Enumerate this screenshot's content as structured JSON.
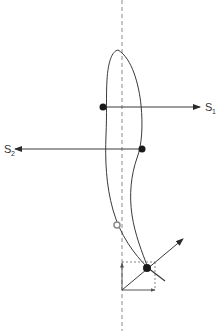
{
  "diagram": {
    "type": "vector-force diagram",
    "colors": {
      "line": "#3a3a3a",
      "dashed_axis": "#8a8a8a",
      "dot": "#1a1a1a",
      "hollow_dot": "#9a9a9a",
      "background": "#ffffff"
    },
    "labels": {
      "s1_main": "S",
      "s1_sub": "1",
      "s2_main": "S",
      "s2_sub": "2"
    },
    "elements": [
      {
        "id": "axis",
        "kind": "dashed-vertical-line",
        "x": 122
      },
      {
        "id": "body",
        "kind": "closed-curve",
        "description": "elongated body shape tapering to a point at bottom"
      },
      {
        "id": "s1",
        "kind": "arrow",
        "from": [
          103,
          107
        ],
        "to": [
          200,
          107
        ],
        "label": "S1"
      },
      {
        "id": "s2",
        "kind": "arrow",
        "from": [
          142,
          149
        ],
        "to": [
          15,
          149
        ],
        "label": "S2"
      },
      {
        "id": "center-marker",
        "kind": "hollow-dot",
        "at": [
          117,
          225
        ]
      },
      {
        "id": "resultant",
        "kind": "arrow",
        "from": [
          122,
          290
        ],
        "to": [
          183,
          239
        ]
      },
      {
        "id": "components",
        "kind": "dotted-rectangle",
        "from": [
          122,
          262
        ],
        "to": [
          155,
          290
        ]
      }
    ]
  }
}
